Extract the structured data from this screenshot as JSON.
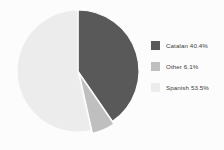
{
  "chart_data": {
    "type": "pie",
    "title": "",
    "categories": [
      "Catalan",
      "Other",
      "Spanish"
    ],
    "values": [
      40.4,
      6.1,
      53.5
    ],
    "value_unit": "%",
    "labels": [
      "Catalan 40.4%",
      "Other 6.1%",
      "Spanish 53.5%"
    ],
    "colors": [
      "#595959",
      "#bfbfbf",
      "#ececec"
    ],
    "start_angle_deg": 0,
    "direction": "clockwise",
    "exploded_slices": [
      "Other"
    ],
    "legend_position": "right",
    "grid": false,
    "background_color": "#fcfcfc"
  },
  "legend": {
    "items": [
      {
        "label": "Catalan 40.4%",
        "color": "#595959",
        "name": "catalan"
      },
      {
        "label": "Other 6.1%",
        "color": "#bfbfbf",
        "name": "other"
      },
      {
        "label": "Spanish 53.5%",
        "color": "#ececec",
        "name": "spanish"
      }
    ]
  },
  "pie": {
    "center_x": 78,
    "center_y": 71,
    "radius": 61,
    "slices": [
      {
        "name": "catalan",
        "start": 0,
        "end": 145.44,
        "color": "#595959",
        "explode": 0
      },
      {
        "name": "other",
        "start": 145.44,
        "end": 167.4,
        "color": "#bfbfbf",
        "explode": 3
      },
      {
        "name": "spanish",
        "start": 167.4,
        "end": 360,
        "color": "#ececec",
        "explode": 0
      }
    ]
  }
}
